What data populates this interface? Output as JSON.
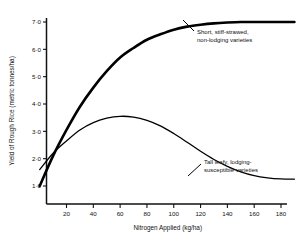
{
  "chart_data": {
    "type": "line",
    "title": "",
    "xlabel": "Nitrogen Applied (kg/ha)",
    "ylabel": "Yield of Rough Rice (metric tonnes/ha)",
    "xlim": [
      0,
      190
    ],
    "ylim": [
      0.6,
      7.3
    ],
    "grid": false,
    "legend_position": "inline-annotations",
    "xticks": [
      20,
      40,
      60,
      80,
      100,
      120,
      140,
      160,
      180
    ],
    "xtick_labels": [
      "20",
      "40",
      "60",
      "80",
      "100",
      "120",
      "140",
      "160",
      "180"
    ],
    "yticks": [
      1.0,
      2.0,
      3.0,
      4.0,
      5.0,
      6.0,
      7.0
    ],
    "ytick_labels": [
      "1·0",
      "2·0",
      "3·0",
      "4·0",
      "5·0",
      "6·0",
      "7·0"
    ],
    "series": [
      {
        "name": "Short, stiff-strawed, non-lodging varieties",
        "style": "thick",
        "x": [
          0,
          10,
          20,
          30,
          40,
          50,
          60,
          70,
          80,
          90,
          100,
          110,
          120,
          130,
          140,
          150,
          160,
          170,
          180,
          190
        ],
        "values": [
          1.0,
          2.1,
          3.05,
          3.9,
          4.6,
          5.2,
          5.7,
          6.05,
          6.35,
          6.55,
          6.72,
          6.83,
          6.9,
          6.95,
          6.98,
          7.0,
          7.0,
          7.0,
          7.0,
          7.0
        ]
      },
      {
        "name": "Tall leafy, lodging-susceptible varieties",
        "style": "thin",
        "x": [
          0,
          10,
          20,
          30,
          40,
          50,
          60,
          70,
          80,
          90,
          100,
          110,
          120,
          130,
          140,
          150,
          160,
          170,
          180,
          190
        ],
        "values": [
          1.6,
          2.2,
          2.65,
          3.05,
          3.32,
          3.48,
          3.55,
          3.52,
          3.4,
          3.2,
          2.92,
          2.6,
          2.27,
          1.97,
          1.72,
          1.52,
          1.38,
          1.3,
          1.26,
          1.25
        ]
      }
    ],
    "annotations": [
      {
        "name": "short-variety-annotation",
        "lines": [
          "Short, stiff-strawed,",
          "non-lodging varieties"
        ],
        "text_x": 197,
        "text_y": 34,
        "leader": {
          "x1": 194,
          "y1": 31,
          "x2": 183,
          "y2": 20
        }
      },
      {
        "name": "tall-variety-annotation",
        "lines": [
          "Tall leafy, lodging-",
          "susceptible varieties"
        ],
        "text_x": 204,
        "text_y": 164,
        "leader": {
          "x1": 201,
          "y1": 164,
          "x2": 188,
          "y2": 176
        }
      }
    ],
    "colors": {
      "curve": "#000000",
      "axis": "#111111",
      "background": "#ffffff"
    }
  }
}
